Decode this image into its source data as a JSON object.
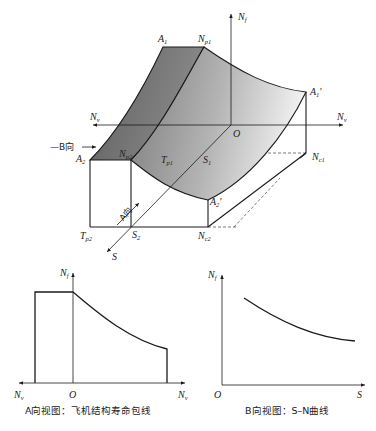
{
  "diagram_3d": {
    "axes": {
      "vertical": "Nf",
      "horizontal_left": "Nv",
      "horizontal_right": "Nv",
      "depth": "S",
      "origin": "O"
    },
    "points": {
      "A1": "A1",
      "Np1": "Np1",
      "A1_prime": "A1'",
      "A2": "A2",
      "Np2": "Np2",
      "Tp1": "Tp1",
      "S1": "S1",
      "Nc1": "Nc1",
      "A2_prime": "A2'",
      "Tp2": "Tp2",
      "S2": "S2",
      "Nc2": "Nc2"
    },
    "view_b_label": "—B向",
    "view_a_label": "A向"
  },
  "view_a": {
    "y_axis": "Nf",
    "x_left": "Nv",
    "x_right": "Nv",
    "origin": "O",
    "caption": "A向视图：飞机结构寿命包线"
  },
  "view_b": {
    "y_axis": "Nf",
    "x_axis": "S",
    "origin": "O",
    "caption": "B向视图：S–N曲线"
  },
  "colors": {
    "line": "#1a1a1a",
    "surface_dark": "#6e6e6e",
    "surface_light": "#e6e6e6",
    "box_face": "#ffffff"
  }
}
